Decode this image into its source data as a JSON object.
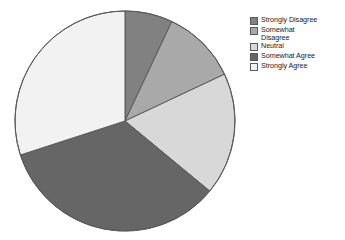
{
  "chart_data": {
    "type": "pie",
    "title": "",
    "subtitle": "",
    "xlabel": "",
    "ylabel": "",
    "legend_position": "right",
    "grid": false,
    "start_angle_deg": 0,
    "direction": "clockwise",
    "categories": [
      "Strongly Disagree",
      "Somewhat\nDisagree",
      "Neutral",
      "Somewhat Agree",
      "Strongly Agree"
    ],
    "values": [
      7,
      11,
      18,
      34,
      30
    ],
    "slice_angles_deg": [
      25.2,
      39.6,
      64.8,
      122.4,
      108.0
    ],
    "colors": [
      "#818181",
      "#a9a9a9",
      "#d8d8d8",
      "#666666",
      "#f2f2f2"
    ],
    "slices": [
      {
        "label": "Strongly Disagree",
        "value": 7,
        "color": "#818181",
        "start_deg": 0.0,
        "end_deg": 25.2
      },
      {
        "label": "Somewhat\nDisagree",
        "value": 11,
        "color": "#a9a9a9",
        "start_deg": 25.2,
        "end_deg": 64.8
      },
      {
        "label": "Neutral",
        "value": 18,
        "color": "#d8d8d8",
        "start_deg": 64.8,
        "end_deg": 129.6
      },
      {
        "label": "Somewhat Agree",
        "value": 34,
        "color": "#666666",
        "start_deg": 129.6,
        "end_deg": 252.0
      },
      {
        "label": "Strongly Agree",
        "value": 30,
        "color": "#f2f2f2",
        "start_deg": 252.0,
        "end_deg": 360.0
      }
    ]
  },
  "legend": {
    "items": [
      {
        "label": "Strongly Disagree",
        "color": "#818181"
      },
      {
        "label": "Somewhat\nDisagree",
        "color": "#a9a9a9"
      },
      {
        "label": "Neutral",
        "color": "#d8d8d8"
      },
      {
        "label": "Somewhat Agree",
        "color": "#666666"
      },
      {
        "label": "Strongly Agree",
        "color": "#f2f2f2"
      }
    ]
  },
  "style": {
    "stroke": "#595959",
    "background": "#ffffff"
  }
}
